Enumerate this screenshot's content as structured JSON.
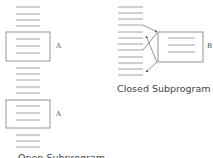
{
  "diagram": {
    "left": {
      "caption": "Open Subprogram",
      "label_top": "A",
      "label_bottom": "A"
    },
    "right": {
      "caption": "Closed Subprogram",
      "label": "B"
    },
    "colors": {
      "line": "#8a8a8a",
      "box": "#7a7a7a",
      "text": "#444444"
    }
  }
}
